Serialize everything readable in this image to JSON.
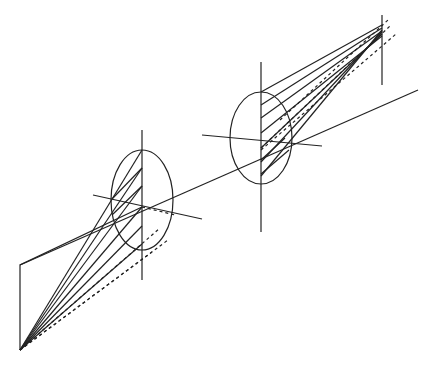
{
  "diagram": {
    "title": "",
    "stroke_color": "#222222",
    "background": "#ffffff",
    "elements": [
      {
        "name": "object-plane",
        "type": "polyline"
      },
      {
        "name": "optical-axis",
        "type": "line"
      },
      {
        "name": "lens-1",
        "type": "ellipse"
      },
      {
        "name": "lens-2",
        "type": "ellipse"
      },
      {
        "name": "image-plane-line",
        "type": "line"
      },
      {
        "name": "solid-rays",
        "type": "lines"
      },
      {
        "name": "dashed-rays",
        "type": "lines"
      }
    ]
  }
}
